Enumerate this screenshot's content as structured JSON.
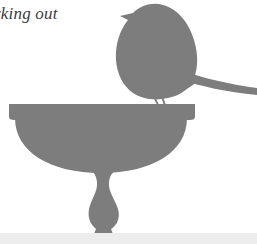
{
  "page": {
    "width": 257,
    "height": 244,
    "background_color": "#ffffff"
  },
  "caption": {
    "text": "rking out",
    "full_text_inferred": "working out",
    "style": "italic-serif",
    "color": "#3a3a3a",
    "clipped_left": true
  },
  "illustration": {
    "title": "bird perched on birdbath silhouette",
    "silhouette_color": "#7d7d7d",
    "parts": [
      {
        "name": "bird-body",
        "label": "Bird",
        "description": "plump songbird silhouette facing left, perched on the birdbath rim"
      },
      {
        "name": "bird-head",
        "label": "Head and beak",
        "description": "rounded head with small pointed beak at upper left"
      },
      {
        "name": "bird-tail",
        "label": "Tail",
        "description": "long tapering tail sweeping right off the image edge"
      },
      {
        "name": "bird-legs",
        "label": "Legs",
        "description": "two thin legs reaching down to the bowl rim"
      },
      {
        "name": "birdbath-rim",
        "label": "Bowl rim",
        "description": "wide flat rectangular rim band across the bath"
      },
      {
        "name": "birdbath-bowl",
        "label": "Bowl",
        "description": "shallow semicircular basin below the rim"
      },
      {
        "name": "birdbath-pedestal",
        "label": "Pedestal",
        "description": "narrow waisted stem widening into a bulb near the base"
      },
      {
        "name": "birdbath-base",
        "label": "Base",
        "description": "small flared foot resting on the ground"
      }
    ]
  },
  "ground": {
    "label": "ground line",
    "color": "#ededed"
  }
}
